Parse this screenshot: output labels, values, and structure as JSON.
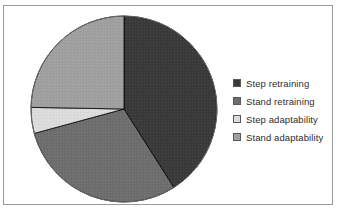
{
  "figure": {
    "top_clipped_text": "............",
    "background_color": "#ffffff",
    "frame_color": "#9a9a9a"
  },
  "legend": {
    "position": "right",
    "items": [
      {
        "label": "Step retraining",
        "color": "#3a3a3a"
      },
      {
        "label": "Stand retraining",
        "color": "#6e6e6e"
      },
      {
        "label": "Step adaptability",
        "color": "#dcdcdc"
      },
      {
        "label": "Stand adaptability",
        "color": "#a0a0a0"
      }
    ]
  },
  "chart_data": {
    "type": "pie",
    "title": "",
    "xlabel": "",
    "ylabel": "",
    "start_angle_deg": 0,
    "direction": "clockwise",
    "grid": false,
    "legend_position": "right",
    "categories": [
      "Step retraining",
      "Stand retraining",
      "Step adaptability",
      "Stand adaptability"
    ],
    "values": [
      41.0,
      29.8,
      4.5,
      24.7
    ],
    "colors": [
      "#3a3a3a",
      "#6e6e6e",
      "#dcdcdc",
      "#a0a0a0"
    ],
    "slice_angles_deg": [
      147.6,
      107.2,
      16.2,
      89.0
    ],
    "slice_boundaries_deg": [
      0,
      147.6,
      254.8,
      271.0,
      360
    ],
    "slice_edge_color": "#000000",
    "labels_shown": false
  }
}
